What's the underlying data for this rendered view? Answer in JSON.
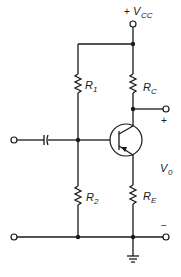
{
  "diagram": {
    "type": "circuit-schematic",
    "labels": {
      "supply": {
        "sign": "+",
        "main": "V",
        "sub": "CC"
      },
      "r1": {
        "main": "R",
        "sub": "1"
      },
      "r2": {
        "main": "R",
        "sub": "2"
      },
      "rc": {
        "main": "R",
        "sub": "C"
      },
      "re": {
        "main": "R",
        "sub": "E"
      },
      "vout": {
        "main": "V",
        "sub": "0"
      },
      "out_plus": "+",
      "out_minus": "−"
    },
    "components": [
      {
        "id": "R1",
        "type": "resistor",
        "connects": [
          "VCC node",
          "base node"
        ]
      },
      {
        "id": "R2",
        "type": "resistor",
        "connects": [
          "base node",
          "ground"
        ]
      },
      {
        "id": "RC",
        "type": "resistor",
        "connects": [
          "VCC node",
          "collector/output"
        ]
      },
      {
        "id": "RE",
        "type": "resistor",
        "connects": [
          "emitter",
          "ground"
        ]
      },
      {
        "id": "Cin",
        "type": "capacitor",
        "connects": [
          "input terminal",
          "base node"
        ]
      },
      {
        "id": "Q1",
        "type": "transistor",
        "polarity": "PNP"
      }
    ],
    "terminals": [
      "VCC",
      "input",
      "input-ground",
      "output+",
      "output-",
      "ground"
    ]
  }
}
